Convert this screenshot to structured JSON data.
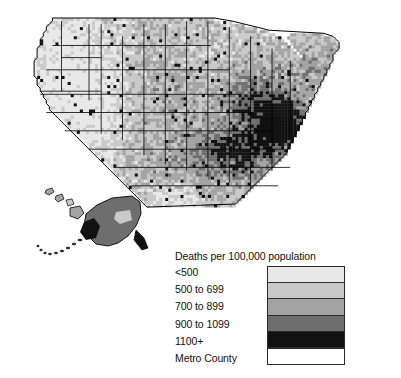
{
  "figure": {
    "kind": "choropleth-map",
    "region": "United States by county",
    "background_color": "#ffffff",
    "outline_color": "#000000"
  },
  "legend": {
    "title": "Deaths per 100,000 population",
    "entries": [
      {
        "label": "<500",
        "color": "#e8e8e8"
      },
      {
        "label": "500 to 699",
        "color": "#c9c9c9"
      },
      {
        "label": "700 to 899",
        "color": "#a3a3a3"
      },
      {
        "label": "900 to 1099",
        "color": "#6e6e6e"
      },
      {
        "label": "1100+",
        "color": "#111111"
      },
      {
        "label": "Metro County",
        "color": "#ffffff"
      }
    ]
  },
  "chart_data": {
    "type": "heatmap",
    "title": "Deaths per 100,000 population",
    "xlabel": "",
    "ylabel": "",
    "classes": [
      "<500",
      "500 to 699",
      "700 to 899",
      "900 to 1099",
      "1100+",
      "Metro County"
    ],
    "class_colors": [
      "#e8e8e8",
      "#c9c9c9",
      "#a3a3a3",
      "#6e6e6e",
      "#111111",
      "#ffffff"
    ],
    "legend_position": "bottom-center",
    "grid": false,
    "insets": [
      "Alaska",
      "Hawaii"
    ],
    "regions": [
      {
        "name": "Pacific Northwest",
        "dominant_class": "500 to 699"
      },
      {
        "name": "Mountain West",
        "dominant_class": "<500"
      },
      {
        "name": "Great Plains",
        "dominant_class": "700 to 899"
      },
      {
        "name": "Upper Midwest",
        "dominant_class": "500 to 699"
      },
      {
        "name": "Ohio Valley",
        "dominant_class": "900 to 1099"
      },
      {
        "name": "Appalachia",
        "dominant_class": "1100+"
      },
      {
        "name": "Deep South",
        "dominant_class": "1100+"
      },
      {
        "name": "Mississippi Delta",
        "dominant_class": "1100+"
      },
      {
        "name": "Texas",
        "dominant_class": "700 to 899"
      },
      {
        "name": "Florida",
        "dominant_class": "<500"
      },
      {
        "name": "Northeast",
        "dominant_class": "700 to 899"
      },
      {
        "name": "Alaska",
        "dominant_class": "900 to 1099"
      },
      {
        "name": "Hawaii",
        "dominant_class": "500 to 699"
      }
    ]
  }
}
